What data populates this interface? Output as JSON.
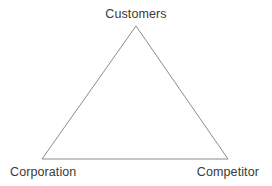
{
  "diagram": {
    "type": "triangle-diagram",
    "name": "3C model triangle",
    "stroke_color": "#8c8c8c",
    "text_color": "#3a3a3a",
    "background_color": "#ffffff",
    "stroke_width": 1,
    "vertices": {
      "apex": {
        "x": 136,
        "y": 26
      },
      "bottom_left": {
        "x": 42,
        "y": 159
      },
      "bottom_right": {
        "x": 228,
        "y": 159
      }
    },
    "nodes": [
      {
        "id": "customers",
        "label": "Customers",
        "position": "apex"
      },
      {
        "id": "corporation",
        "label": "Corporation",
        "position": "bottom-left"
      },
      {
        "id": "competitor",
        "label": "Competitor",
        "position": "bottom-right"
      }
    ]
  }
}
